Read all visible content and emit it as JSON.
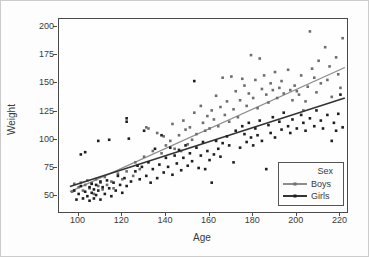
{
  "chart_data": {
    "type": "scatter",
    "title": "",
    "xlabel": "Age",
    "ylabel": "Weight",
    "xlim": [
      91,
      223
    ],
    "ylim": [
      36,
      207
    ],
    "xticks": [
      100,
      120,
      140,
      160,
      180,
      200,
      220
    ],
    "yticks": [
      50,
      75,
      100,
      125,
      150,
      175,
      200
    ],
    "grid": false,
    "legend": {
      "title": "Sex",
      "position": "lower right"
    },
    "series": [
      {
        "name": "Boys",
        "line_color": "#8d8d8d",
        "marker_color": "#6e6e6e",
        "trend_line": {
          "x1": 96,
          "y1": 54,
          "x2": 222,
          "y2": 164
        },
        "points": [
          [
            97,
            54
          ],
          [
            98,
            61
          ],
          [
            100,
            58
          ],
          [
            101,
            62
          ],
          [
            102,
            55
          ],
          [
            103,
            60
          ],
          [
            104,
            64
          ],
          [
            105,
            57
          ],
          [
            106,
            61
          ],
          [
            107,
            52
          ],
          [
            108,
            65
          ],
          [
            109,
            59
          ],
          [
            110,
            62
          ],
          [
            111,
            56
          ],
          [
            112,
            67
          ],
          [
            113,
            60
          ],
          [
            115,
            63
          ],
          [
            116,
            57
          ],
          [
            118,
            70
          ],
          [
            120,
            65
          ],
          [
            122,
            72
          ],
          [
            125,
            68
          ],
          [
            126,
            80
          ],
          [
            128,
            74
          ],
          [
            130,
            85
          ],
          [
            131,
            111
          ],
          [
            132,
            110
          ],
          [
            134,
            90
          ],
          [
            136,
            106
          ],
          [
            138,
            88
          ],
          [
            139,
            103
          ],
          [
            140,
            95
          ],
          [
            142,
            99
          ],
          [
            143,
            114
          ],
          [
            144,
            92
          ],
          [
            146,
            104
          ],
          [
            147,
            90
          ],
          [
            148,
            117
          ],
          [
            149,
            109
          ],
          [
            150,
            96
          ],
          [
            151,
            111
          ],
          [
            152,
            100
          ],
          [
            153,
            124
          ],
          [
            154,
            105
          ],
          [
            156,
            130
          ],
          [
            157,
            115
          ],
          [
            158,
            108
          ],
          [
            159,
            121
          ],
          [
            160,
            110
          ],
          [
            161,
            126
          ],
          [
            162,
            118
          ],
          [
            163,
            139
          ],
          [
            164,
            112
          ],
          [
            165,
            129
          ],
          [
            166,
            155
          ],
          [
            167,
            122
          ],
          [
            168,
            134
          ],
          [
            169,
            116
          ],
          [
            170,
            156
          ],
          [
            171,
            127
          ],
          [
            172,
            143
          ],
          [
            173,
            120
          ],
          [
            174,
            135
          ],
          [
            175,
            154
          ],
          [
            176,
            148
          ],
          [
            177,
            130
          ],
          [
            178,
            141
          ],
          [
            179,
            175
          ],
          [
            180,
            137
          ],
          [
            181,
            153
          ],
          [
            182,
            128
          ],
          [
            183,
            172
          ],
          [
            184,
            145
          ],
          [
            185,
            157
          ],
          [
            186,
            140
          ],
          [
            187,
            133
          ],
          [
            188,
            150
          ],
          [
            189,
            144
          ],
          [
            190,
            160
          ],
          [
            191,
            137
          ],
          [
            192,
            146
          ],
          [
            193,
            152
          ],
          [
            194,
            141
          ],
          [
            196,
            162
          ],
          [
            197,
            144
          ],
          [
            198,
            135
          ],
          [
            199,
            148
          ],
          [
            200,
            143
          ],
          [
            201,
            140
          ],
          [
            202,
            157
          ],
          [
            203,
            126
          ],
          [
            204,
            134
          ],
          [
            205,
            147
          ],
          [
            206,
            196
          ],
          [
            207,
            163
          ],
          [
            208,
            155
          ],
          [
            209,
            142
          ],
          [
            210,
            170
          ],
          [
            211,
            150
          ],
          [
            213,
            182
          ],
          [
            214,
            153
          ],
          [
            215,
            165
          ],
          [
            216,
            138
          ],
          [
            218,
            173
          ],
          [
            219,
            158
          ],
          [
            220,
            146
          ],
          [
            221,
            190
          ]
        ]
      },
      {
        "name": "Girls",
        "line_color": "#343434",
        "marker_color": "#1e1e1e",
        "trend_line": {
          "x1": 96,
          "y1": 58.5,
          "x2": 222,
          "y2": 137
        },
        "points": [
          [
            98,
            55
          ],
          [
            99,
            47
          ],
          [
            100,
            52
          ],
          [
            101,
            59
          ],
          [
            102,
            48
          ],
          [
            103,
            54
          ],
          [
            104,
            50
          ],
          [
            105,
            46
          ],
          [
            105,
            58
          ],
          [
            106,
            53
          ],
          [
            106,
            61
          ],
          [
            107,
            48
          ],
          [
            107,
            56
          ],
          [
            108,
            51
          ],
          [
            108,
            60
          ],
          [
            109,
            55
          ],
          [
            110,
            47
          ],
          [
            110,
            63
          ],
          [
            111,
            58
          ],
          [
            112,
            52
          ],
          [
            113,
            64
          ],
          [
            114,
            57
          ],
          [
            115,
            50
          ],
          [
            116,
            62
          ],
          [
            117,
            55
          ],
          [
            118,
            68
          ],
          [
            119,
            60
          ],
          [
            120,
            53
          ],
          [
            121,
            66
          ],
          [
            122,
            59
          ],
          [
            124,
            63
          ],
          [
            101,
            87
          ],
          [
            103,
            89
          ],
          [
            109,
            99
          ],
          [
            114,
            100
          ],
          [
            122,
            119
          ],
          [
            122,
            116
          ],
          [
            123,
            101
          ],
          [
            130,
            108
          ],
          [
            135,
            92
          ],
          [
            138,
            104
          ],
          [
            142,
            93
          ],
          [
            145,
            79
          ],
          [
            148,
            84
          ],
          [
            153,
            152
          ],
          [
            156,
            86
          ],
          [
            126,
            72
          ],
          [
            127,
            77
          ],
          [
            128,
            65
          ],
          [
            129,
            76
          ],
          [
            131,
            68
          ],
          [
            132,
            80
          ],
          [
            133,
            62
          ],
          [
            134,
            74
          ],
          [
            136,
            66
          ],
          [
            137,
            78
          ],
          [
            139,
            71
          ],
          [
            140,
            84
          ],
          [
            141,
            76
          ],
          [
            143,
            69
          ],
          [
            144,
            86
          ],
          [
            146,
            91
          ],
          [
            147,
            73
          ],
          [
            149,
            95
          ],
          [
            150,
            77
          ],
          [
            151,
            88
          ],
          [
            152,
            81
          ],
          [
            154,
            93
          ],
          [
            155,
            75
          ],
          [
            157,
            98
          ],
          [
            158,
            74
          ],
          [
            159,
            90
          ],
          [
            160,
            82
          ],
          [
            161,
            62
          ],
          [
            162,
            87
          ],
          [
            163,
            99
          ],
          [
            164,
            92
          ],
          [
            165,
            85
          ],
          [
            166,
            97
          ],
          [
            168,
            103
          ],
          [
            169,
            95
          ],
          [
            171,
            80
          ],
          [
            172,
            108
          ],
          [
            174,
            93
          ],
          [
            175,
            112
          ],
          [
            176,
            105
          ],
          [
            177,
            98
          ],
          [
            178,
            115
          ],
          [
            179,
            102
          ],
          [
            180,
            95
          ],
          [
            181,
            110
          ],
          [
            182,
            104
          ],
          [
            183,
            117
          ],
          [
            184,
            99
          ],
          [
            186,
            74
          ],
          [
            187,
            113
          ],
          [
            188,
            106
          ],
          [
            189,
            120
          ],
          [
            190,
            102
          ],
          [
            192,
            116
          ],
          [
            193,
            109
          ],
          [
            194,
            124
          ],
          [
            196,
            112
          ],
          [
            197,
            106
          ],
          [
            198,
            118
          ],
          [
            200,
            110
          ],
          [
            202,
            122
          ],
          [
            203,
            115
          ],
          [
            204,
            108
          ],
          [
            206,
            119
          ],
          [
            208,
            112
          ],
          [
            209,
            126
          ],
          [
            211,
            117
          ],
          [
            212,
            110
          ],
          [
            214,
            122
          ],
          [
            216,
            99
          ],
          [
            217,
            115
          ],
          [
            218,
            108
          ],
          [
            219,
            123
          ],
          [
            220,
            140
          ],
          [
            221,
            111
          ]
        ]
      }
    ]
  }
}
